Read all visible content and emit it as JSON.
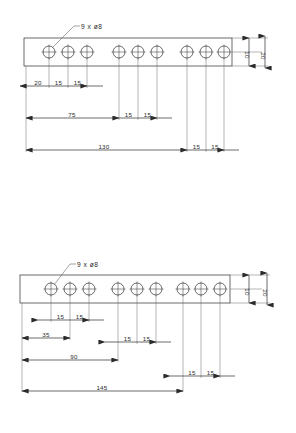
{
  "drawing": {
    "title": "Perforated flat bar hole pattern drawings",
    "units": "mm",
    "line_color": "#2b2b2b",
    "background": "#ffffff",
    "views": [
      {
        "name": "top-view",
        "callout": "9 x ø8",
        "hole_count": 9,
        "hole_diameter": 8,
        "bar_height_label": "20",
        "hole_center_from_top_label": "10",
        "groups": [
          {
            "name": "left-group",
            "holes": 3,
            "pitch": 15
          },
          {
            "name": "middle-group",
            "holes": 3,
            "pitch": 15
          },
          {
            "name": "right-group",
            "holes": 3,
            "pitch": 15
          }
        ],
        "dim_rows": [
          {
            "name": "row-1",
            "labels": [
              "20",
              "15",
              "15"
            ]
          },
          {
            "name": "row-2",
            "labels": [
              "75",
              "15",
              "15"
            ]
          },
          {
            "name": "row-3",
            "labels": [
              "130",
              "15",
              "15"
            ]
          }
        ],
        "dims": {
          "first_hole_offset": "20",
          "pitch": "15",
          "to_group2": "75",
          "to_group3": "130",
          "thickness": "20",
          "edge_to_center": "10"
        }
      },
      {
        "name": "bottom-view",
        "callout": "9 x ø8",
        "hole_count": 9,
        "hole_diameter": 8,
        "bar_height_label": "20",
        "hole_center_from_top_label": "10",
        "groups": [
          {
            "name": "left-group",
            "holes": 3,
            "pitch": 15
          },
          {
            "name": "middle-group",
            "holes": 3,
            "pitch": 15
          },
          {
            "name": "right-group",
            "holes": 3,
            "pitch": 15
          }
        ],
        "dim_rows": [
          {
            "name": "row-1",
            "labels": [
              "15",
              "15"
            ]
          },
          {
            "name": "row-2",
            "labels": [
              "35",
              "15",
              "15"
            ]
          },
          {
            "name": "row-3",
            "labels": [
              "90",
              "15",
              "15"
            ]
          },
          {
            "name": "row-4",
            "labels": [
              "145"
            ]
          }
        ],
        "dims": {
          "pitch": "15",
          "to_first_group_end": "35",
          "to_group2": "90",
          "to_group3": "145",
          "thickness": "20",
          "edge_to_center": "10"
        }
      }
    ]
  }
}
